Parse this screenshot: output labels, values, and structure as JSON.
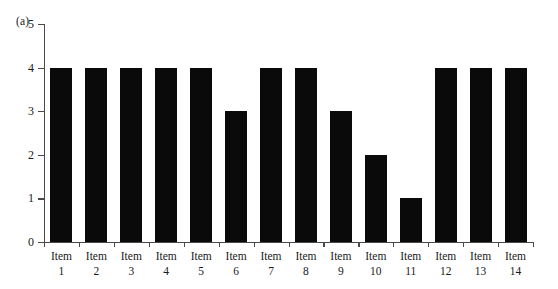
{
  "figure": {
    "panel_label": "(a)",
    "background_color": "#ffffff",
    "bar_color": "#0a0a0a",
    "axis_color": "#4a4a4a"
  },
  "chart_data": {
    "type": "bar",
    "title": "",
    "subtitle": "",
    "xlabel": "",
    "ylabel": "",
    "panel": "(a)",
    "categories": [
      "Item 1",
      "Item 2",
      "Item 3",
      "Item 4",
      "Item 5",
      "Item 6",
      "Item 7",
      "Item 8",
      "Item 9",
      "Item 10",
      "Item 11",
      "Item 12",
      "Item 13",
      "Item 14"
    ],
    "category_lines": [
      {
        "name": "Item",
        "num": "1"
      },
      {
        "name": "Item",
        "num": "2"
      },
      {
        "name": "Item",
        "num": "3"
      },
      {
        "name": "Item",
        "num": "4"
      },
      {
        "name": "Item",
        "num": "5"
      },
      {
        "name": "Item",
        "num": "6"
      },
      {
        "name": "Item",
        "num": "7"
      },
      {
        "name": "Item",
        "num": "8"
      },
      {
        "name": "Item",
        "num": "9"
      },
      {
        "name": "Item",
        "num": "10"
      },
      {
        "name": "Item",
        "num": "11"
      },
      {
        "name": "Item",
        "num": "12"
      },
      {
        "name": "Item",
        "num": "13"
      },
      {
        "name": "Item",
        "num": "14"
      }
    ],
    "values": [
      4,
      4,
      4,
      4,
      4,
      3,
      4,
      4,
      3,
      2,
      1,
      4,
      4,
      4
    ],
    "ylim": [
      0,
      5
    ],
    "ytick_labels": [
      "0",
      "1",
      "2",
      "3",
      "4",
      "5"
    ],
    "ytick_values": [
      0,
      1,
      2,
      3,
      4,
      5
    ],
    "grid": false,
    "legend": null,
    "legend_position": "none",
    "series": [
      {
        "name": "",
        "values": [
          4,
          4,
          4,
          4,
          4,
          3,
          4,
          4,
          3,
          2,
          1,
          4,
          4,
          4
        ]
      }
    ]
  }
}
